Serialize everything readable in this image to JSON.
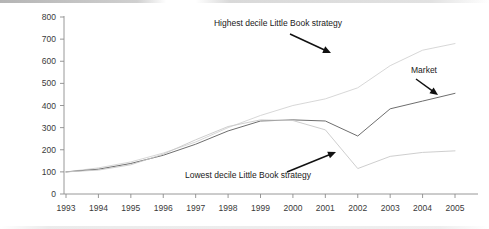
{
  "chart_data": {
    "type": "line",
    "title": "",
    "subtitle": "",
    "xlabel": "",
    "ylabel": "",
    "x": [
      1993,
      1994,
      1995,
      1996,
      1997,
      1998,
      1999,
      2000,
      2001,
      2002,
      2003,
      2004,
      2005
    ],
    "xtick_labels": [
      "1993",
      "1994",
      "1995",
      "1996",
      "1997",
      "1998",
      "1999",
      "2000",
      "2001",
      "2002",
      "2003",
      "2004",
      "2005"
    ],
    "ytick_labels": [
      "0",
      "100",
      "200",
      "300",
      "400",
      "500",
      "600",
      "700",
      "800"
    ],
    "yticks": [
      0,
      100,
      200,
      300,
      400,
      500,
      600,
      700,
      800
    ],
    "ylim": [
      0,
      800
    ],
    "xlim": [
      1993,
      2005
    ],
    "grid": false,
    "legend_position": "none",
    "series": [
      {
        "name": "Highest decile Little Book strategy",
        "color": "#d2d2d2",
        "values": [
          100,
          118,
          145,
          185,
          235,
          300,
          355,
          400,
          430,
          480,
          580,
          650,
          680
        ]
      },
      {
        "name": "Market",
        "color": "#6e6e6e",
        "values": [
          100,
          112,
          138,
          175,
          225,
          285,
          330,
          335,
          330,
          262,
          385,
          420,
          455
        ]
      },
      {
        "name": "Lowest decile Little Book strategy",
        "color": "#c8c8c8",
        "values": [
          100,
          108,
          132,
          180,
          245,
          305,
          335,
          332,
          290,
          115,
          170,
          188,
          195
        ]
      }
    ],
    "annotations": [
      {
        "name": "highest-decile-annotation",
        "text": "Highest decile Little Book strategy",
        "label_x": 278,
        "label_y": 26,
        "anchor": "middle",
        "arrow_from_x": 290,
        "arrow_from_y": 34,
        "arrow_to_x": 331,
        "arrow_to_y": 53
      },
      {
        "name": "market-annotation",
        "text": "Market",
        "label_x": 424,
        "label_y": 73,
        "anchor": "middle",
        "arrow_from_x": 416,
        "arrow_from_y": 79,
        "arrow_to_x": 438,
        "arrow_to_y": 95
      },
      {
        "name": "lowest-decile-annotation",
        "text": "Lowest decile Little Book strategy",
        "label_x": 248,
        "label_y": 178,
        "anchor": "middle",
        "arrow_from_x": 287,
        "arrow_from_y": 172,
        "arrow_to_x": 336,
        "arrow_to_y": 152
      }
    ]
  }
}
